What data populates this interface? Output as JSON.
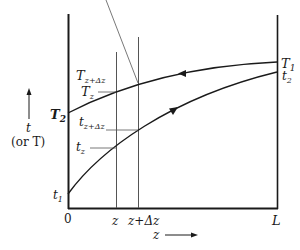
{
  "diagram": {
    "type": "countercurrent temperature profile",
    "y_axis": {
      "label_top": "t",
      "label_bottom": "(or T)",
      "direction": "up"
    },
    "x_axis": {
      "label": "z",
      "direction": "right",
      "ticks": [
        "0",
        "z",
        "z+Δz",
        "L"
      ]
    },
    "curves": [
      {
        "name": "hot-fluid-T",
        "start_label": "T2",
        "end_label": "T1",
        "flow": "right-to-left"
      },
      {
        "name": "cold-fluid-t",
        "start_label": "t1",
        "end_label": "t2",
        "flow": "left-to-right"
      }
    ],
    "labels": {
      "T1": "T",
      "T1_sub": "1",
      "t2": "t",
      "t2_sub": "2",
      "T2": "T",
      "T2_sub": "2",
      "t1": "t",
      "t1_sub": "1",
      "Tzdz": "T",
      "Tzdz_sub": "z+Δz",
      "Tz": "T",
      "Tz_sub": "z",
      "tzdz": "t",
      "tzdz_sub": "z+Δz",
      "tz": "t",
      "tz_sub": "z",
      "tick_0": "0",
      "tick_z": "z",
      "tick_zdz": "z+Δz",
      "tick_L": "L",
      "xlabel": "z",
      "ylabel_t": "t",
      "ylabel_or": "(or T)"
    },
    "colors": {
      "ink": "#1a1a1a",
      "thin": "#555555",
      "background": "#ffffff"
    }
  }
}
